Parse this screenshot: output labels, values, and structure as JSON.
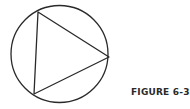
{
  "figure": {
    "label": "FIGURE 6-36",
    "stroke_color": "#2a2a2a",
    "circle": {
      "cx": 59.5,
      "cy": 54,
      "r": 48.5
    },
    "triangle": {
      "points": [
        [
          38,
          12
        ],
        [
          109,
          57
        ],
        [
          34,
          94
        ]
      ]
    }
  }
}
